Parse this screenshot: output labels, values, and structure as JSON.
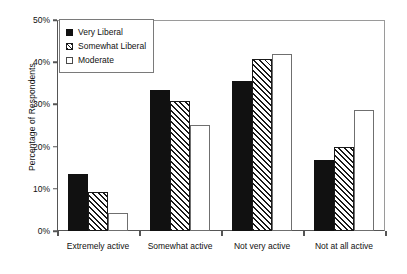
{
  "chart_data": {
    "type": "bar",
    "title": "",
    "xlabel": "",
    "ylabel": "Percentage of Respondents",
    "ylim": [
      0,
      50
    ],
    "ytick_labels": [
      "0%",
      "10%",
      "20%",
      "30%",
      "40%",
      "50%"
    ],
    "ytick_values": [
      0,
      10,
      20,
      30,
      40,
      50
    ],
    "grid": false,
    "legend_position": "upper-left-inside",
    "categories": [
      "Extremely active",
      "Somewhat active",
      "Not very active",
      "Not at all active"
    ],
    "series": [
      {
        "name": "Very Liberal",
        "style": "solid-black",
        "values": [
          13.5,
          33.5,
          35.6,
          16.8
        ]
      },
      {
        "name": "Somewhat Liberal",
        "style": "diagonal-hatch",
        "values": [
          9.3,
          30.8,
          40.7,
          20.0
        ]
      },
      {
        "name": "Moderate",
        "style": "white-outline",
        "values": [
          4.3,
          25.2,
          42.0,
          28.6
        ]
      }
    ]
  },
  "colors": {
    "series_very_liberal": "#111111",
    "series_somewhat_liberal": "#1a1a1a",
    "series_moderate": "#ffffff",
    "axis": "#555555",
    "frame": "#9a9a9a",
    "background": "#ffffff"
  }
}
